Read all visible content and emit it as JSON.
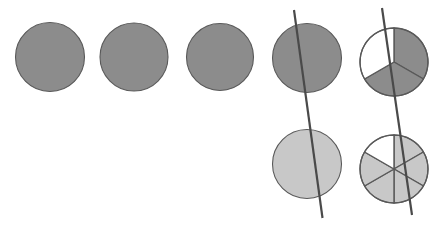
{
  "figure": {
    "canvas": {
      "width": 447,
      "height": 225,
      "background": "#ffffff"
    },
    "colors": {
      "dark_fill": "#8c8c8c",
      "light_fill": "#c8c8c8",
      "empty_fill": "#ffffff",
      "stroke": "#595959",
      "line": "#4a4a4a"
    },
    "stroke_widths": {
      "circle_outline": 1.1,
      "divider": 1.4,
      "long_line": 2.2
    },
    "circles": [
      {
        "name": "whole-circle-1",
        "row": "top",
        "column": 1,
        "cx": 50,
        "cy": 57,
        "r": 34.5,
        "fill": "dark",
        "divisions": 1,
        "shaded_count": 1,
        "label": "1 whole"
      },
      {
        "name": "whole-circle-2",
        "row": "top",
        "column": 2,
        "cx": 134,
        "cy": 57,
        "r": 34,
        "fill": "dark",
        "divisions": 1,
        "shaded_count": 1,
        "label": "1 whole"
      },
      {
        "name": "whole-circle-3",
        "row": "top",
        "column": 3,
        "cx": 220,
        "cy": 57,
        "r": 33.5,
        "fill": "dark",
        "divisions": 1,
        "shaded_count": 1,
        "label": "1 whole"
      },
      {
        "name": "whole-circle-4",
        "row": "top",
        "column": 4,
        "cx": 307,
        "cy": 58,
        "r": 34.5,
        "fill": "dark",
        "divisions": 1,
        "shaded_count": 1,
        "label": "1 whole"
      },
      {
        "name": "thirds-circle-top",
        "row": "top",
        "column": 5,
        "cx": 394,
        "cy": 62,
        "r": 34,
        "fill": "dark",
        "divisions": 3,
        "shaded_count": 2,
        "sector_start_deg": -90,
        "shaded_sectors": [
          0,
          1
        ],
        "label": "2 thirds shaded"
      },
      {
        "name": "whole-circle-5",
        "row": "bottom",
        "column": 4,
        "cx": 307,
        "cy": 164,
        "r": 34.5,
        "fill": "light",
        "divisions": 1,
        "shaded_count": 1,
        "label": "1 whole"
      },
      {
        "name": "sixths-circle-bottom",
        "row": "bottom",
        "column": 5,
        "cx": 394,
        "cy": 169,
        "r": 34,
        "fill": "light",
        "divisions": 6,
        "shaded_count": 5,
        "sector_start_deg": -90,
        "shaded_sectors": [
          0,
          1,
          2,
          3,
          4
        ],
        "label": "5 sixths shaded"
      }
    ],
    "lines": [
      {
        "name": "cut-line-column-4",
        "x1": 294,
        "y1": 10,
        "x2": 322.5,
        "y2": 218
      },
      {
        "name": "cut-line-column-5",
        "x1": 382,
        "y1": 8,
        "x2": 412,
        "y2": 215
      }
    ]
  }
}
